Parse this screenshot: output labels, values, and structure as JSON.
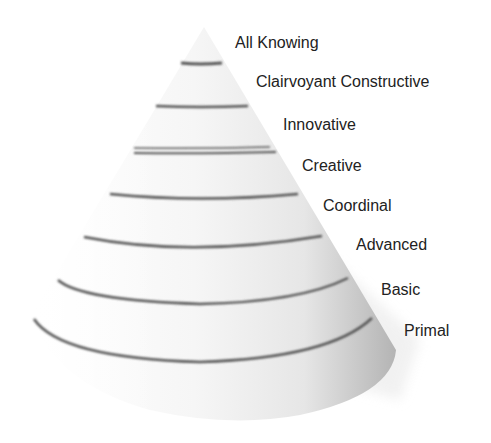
{
  "diagram": {
    "type": "cone-hierarchy",
    "levels": [
      {
        "label": "All Knowing",
        "x": 235,
        "y": 34
      },
      {
        "label": "Clairvoyant Constructive",
        "x": 256,
        "y": 73
      },
      {
        "label": "Innovative",
        "x": 283,
        "y": 116
      },
      {
        "label": "Creative",
        "x": 302,
        "y": 157
      },
      {
        "label": "Coordinal",
        "x": 323,
        "y": 197
      },
      {
        "label": "Advanced",
        "x": 356,
        "y": 236
      },
      {
        "label": "Basic",
        "x": 381,
        "y": 281
      },
      {
        "label": "Primal",
        "x": 404,
        "y": 322
      }
    ],
    "colors": {
      "background": "#ffffff",
      "cone_light": "#f4f4f4",
      "cone_shadow": "#b8b8b8",
      "ring": "#555555",
      "text": "#222222"
    }
  }
}
